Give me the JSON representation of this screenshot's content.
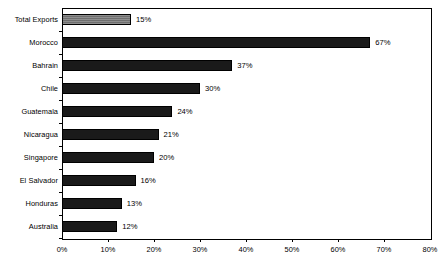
{
  "chart_data": {
    "type": "bar",
    "orientation": "horizontal",
    "title": "",
    "subtitle": "",
    "xlabel": "",
    "ylabel": "",
    "xlim": [
      0,
      80
    ],
    "xtick_step": 10,
    "grid": false,
    "legend": false,
    "value_suffix": "%",
    "categories": [
      "Total Exports",
      "Morocco",
      "Bahrain",
      "Chile",
      "Guatemala",
      "Nicaragua",
      "Singapore",
      "El Salvador",
      "Honduras",
      "Australia"
    ],
    "values": [
      15,
      67,
      37,
      30,
      24,
      21,
      20,
      16,
      13,
      12
    ],
    "data_labels": [
      "15%",
      "67%",
      "37%",
      "30%",
      "24%",
      "21%",
      "20%",
      "16%",
      "13%",
      "12%"
    ],
    "xticklabels": [
      "0%",
      "10%",
      "20%",
      "30%",
      "40%",
      "50%",
      "60%",
      "70%",
      "80%"
    ],
    "xtick_values": [
      0,
      10,
      20,
      30,
      40,
      50,
      60,
      70,
      80
    ],
    "bar_styles": [
      "gray",
      "solid",
      "solid",
      "solid",
      "solid",
      "solid",
      "solid",
      "solid",
      "solid",
      "solid"
    ],
    "colors": {
      "bar_solid": "#1a1a1a",
      "bar_highlight": "#6e6e6e",
      "bar_outline": "#000000",
      "axis": "#000000",
      "text": "#000000",
      "background": "#ffffff"
    }
  }
}
